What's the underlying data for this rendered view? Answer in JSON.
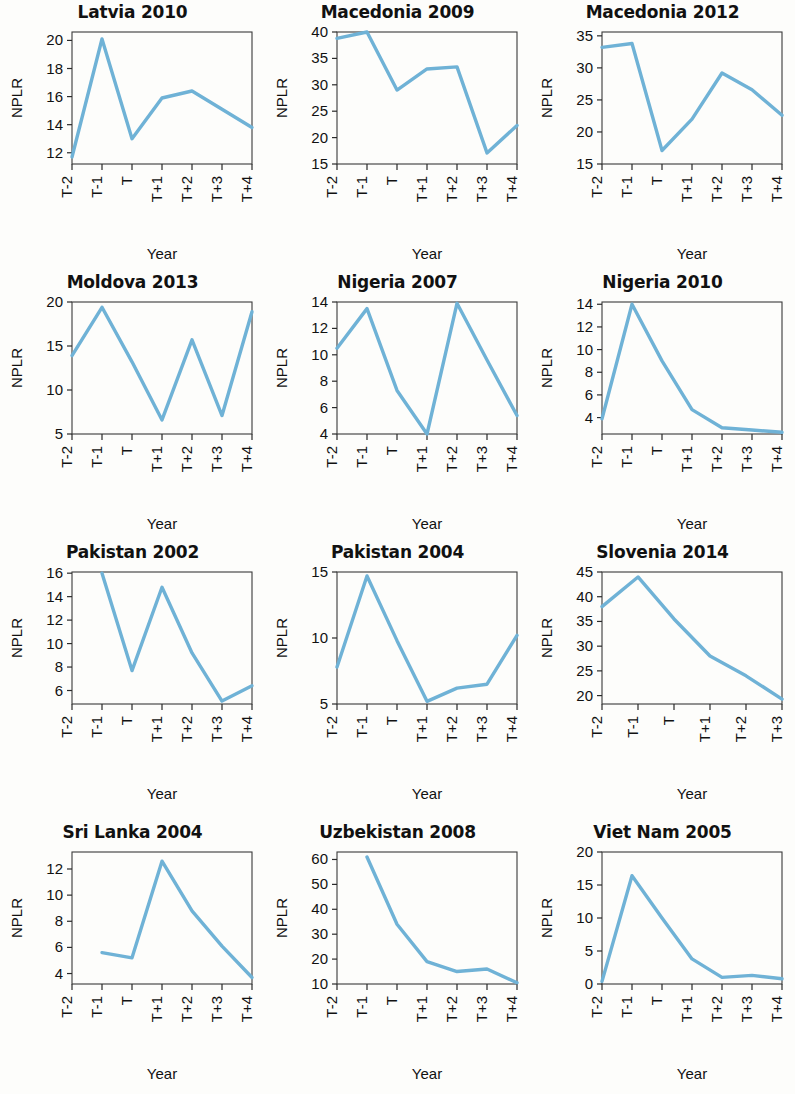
{
  "figure": {
    "line_color": "#6FB2D6",
    "axis_color": "#2a2a2a",
    "background": "#fdfdfb",
    "x_axis_label": "Year",
    "y_axis_label": "NPLR",
    "x_categories": [
      "T-2",
      "T-1",
      "T",
      "T+1",
      "T+2",
      "T+3",
      "T+4"
    ]
  },
  "chart_data": [
    {
      "type": "line",
      "title": "Latvia 2010",
      "xlabel": "Year",
      "ylabel": "NPLR",
      "x": [
        "T-2",
        "T-1",
        "T",
        "T+1",
        "T+2",
        "T+3",
        "T+4"
      ],
      "values": [
        11.7,
        20.1,
        13.0,
        15.9,
        16.4,
        15.1,
        13.8
      ],
      "ylim": [
        11.2,
        20.6
      ],
      "yticks": [
        12,
        14,
        16,
        18,
        20
      ],
      "ytick_labels": [
        "12",
        "14",
        "16",
        "18",
        "20"
      ],
      "xtick_labels": [
        "T-2",
        "T-1",
        "T",
        "T+1",
        "T+2",
        "T+3",
        "T+4"
      ],
      "grid": false,
      "legend": "none"
    },
    {
      "type": "line",
      "title": "Macedonia 2009",
      "xlabel": "Year",
      "ylabel": "NPLR",
      "x": [
        "T-2",
        "T-1",
        "T",
        "T+1",
        "T+2",
        "T+3",
        "T+4"
      ],
      "values": [
        38.8,
        40.0,
        29.0,
        33.0,
        33.4,
        17.1,
        22.3
      ],
      "ylim": [
        15,
        40
      ],
      "yticks": [
        15,
        20,
        25,
        30,
        35,
        40
      ],
      "ytick_labels": [
        "15",
        "20",
        "25",
        "30",
        "35",
        "40"
      ],
      "xtick_labels": [
        "T-2",
        "T-1",
        "T",
        "T+1",
        "T+2",
        "T+3",
        "T+4"
      ],
      "grid": false,
      "legend": "none"
    },
    {
      "type": "line",
      "title": "Macedonia 2012",
      "xlabel": "Year",
      "ylabel": "NPLR",
      "x": [
        "T-2",
        "T-1",
        "T",
        "T+1",
        "T+2",
        "T+3",
        "T+4"
      ],
      "values": [
        33.2,
        33.8,
        17.1,
        22.0,
        29.2,
        26.6,
        22.6
      ],
      "ylim": [
        15,
        35.6
      ],
      "yticks": [
        15,
        20,
        25,
        30,
        35
      ],
      "ytick_labels": [
        "15",
        "20",
        "25",
        "30",
        "35"
      ],
      "xtick_labels": [
        "T-2",
        "T-1",
        "T",
        "T+1",
        "T+2",
        "T+3",
        "T+4"
      ],
      "grid": false,
      "legend": "none"
    },
    {
      "type": "line",
      "title": "Moldova 2013",
      "xlabel": "Year",
      "ylabel": "NPLR",
      "x": [
        "T-2",
        "T-1",
        "T",
        "T+1",
        "T+2",
        "T+3",
        "T+4"
      ],
      "values": [
        13.9,
        19.4,
        13.2,
        6.6,
        15.7,
        7.1,
        18.9
      ],
      "ylim": [
        5,
        20
      ],
      "yticks": [
        5,
        10,
        15,
        20
      ],
      "ytick_labels": [
        "5",
        "10",
        "15",
        "20"
      ],
      "xtick_labels": [
        "T-2",
        "T-1",
        "T",
        "T+1",
        "T+2",
        "T+3",
        "T+4"
      ],
      "grid": false,
      "legend": "none"
    },
    {
      "type": "line",
      "title": "Nigeria 2007",
      "xlabel": "Year",
      "ylabel": "NPLR",
      "x": [
        "T-2",
        "T-1",
        "T",
        "T+1",
        "T+2",
        "T+3",
        "T+4"
      ],
      "values": [
        10.5,
        13.5,
        7.3,
        4.0,
        13.9,
        9.6,
        5.4
      ],
      "ylim": [
        4,
        14
      ],
      "yticks": [
        4,
        6,
        8,
        10,
        12,
        14
      ],
      "ytick_labels": [
        "4",
        "6",
        "8",
        "10",
        "12",
        "14"
      ],
      "xtick_labels": [
        "T-2",
        "T-1",
        "T",
        "T+1",
        "T+2",
        "T+3",
        "T+4"
      ],
      "grid": false,
      "legend": "none"
    },
    {
      "type": "line",
      "title": "Nigeria 2010",
      "xlabel": "Year",
      "ylabel": "NPLR",
      "x": [
        "T-2",
        "T-1",
        "T",
        "T+1",
        "T+2",
        "T+3",
        "T+4"
      ],
      "values": [
        3.9,
        14.0,
        9.0,
        4.7,
        3.1,
        2.9,
        2.7
      ],
      "ylim": [
        2.55,
        14.2
      ],
      "yticks": [
        4,
        6,
        8,
        10,
        12,
        14
      ],
      "ytick_labels": [
        "4",
        "6",
        "8",
        "10",
        "12",
        "14"
      ],
      "xtick_labels": [
        "T-2",
        "T-1",
        "T",
        "T+1",
        "T+2",
        "T+3",
        "T+4"
      ],
      "grid": false,
      "legend": "none"
    },
    {
      "type": "line",
      "title": "Pakistan 2002",
      "xlabel": "Year",
      "ylabel": "NPLR",
      "x": [
        "T-1",
        "T",
        "T+1",
        "T+2",
        "T+3",
        "T+4"
      ],
      "values": [
        16.0,
        7.7,
        14.8,
        9.2,
        5.1,
        6.4
      ],
      "ylim": [
        4.85,
        16.1
      ],
      "yticks": [
        6,
        8,
        10,
        12,
        14,
        16
      ],
      "ytick_labels": [
        "6",
        "8",
        "10",
        "12",
        "14",
        "16"
      ],
      "xtick_labels": [
        "T-2",
        "T-1",
        "T",
        "T+1",
        "T+2",
        "T+3",
        "T+4"
      ],
      "grid": false,
      "legend": "none"
    },
    {
      "type": "line",
      "title": "Pakistan 2004",
      "xlabel": "Year",
      "ylabel": "NPLR",
      "x": [
        "T-2",
        "T-1",
        "T",
        "T+1",
        "T+2",
        "T+3",
        "T+4"
      ],
      "values": [
        7.8,
        14.7,
        9.8,
        5.2,
        6.2,
        6.5,
        10.2
      ],
      "ylim": [
        5,
        15
      ],
      "yticks": [
        5,
        10,
        15
      ],
      "ytick_labels": [
        "5",
        "10",
        "15"
      ],
      "xtick_labels": [
        "T-2",
        "T-1",
        "T",
        "T+1",
        "T+2",
        "T+3",
        "T+4"
      ],
      "grid": false,
      "legend": "none"
    },
    {
      "type": "line",
      "title": "Slovenia 2014",
      "xlabel": "Year",
      "ylabel": "NPLR",
      "x": [
        "T-2",
        "T-1",
        "T",
        "T+1",
        "T+2",
        "T+3"
      ],
      "values": [
        38.0,
        44.0,
        35.5,
        28.0,
        24.0,
        19.3
      ],
      "ylim": [
        18.3,
        45
      ],
      "yticks": [
        20,
        25,
        30,
        35,
        40,
        45
      ],
      "ytick_labels": [
        "20",
        "25",
        "30",
        "35",
        "40",
        "45"
      ],
      "xtick_labels": [
        "T-2",
        "T-1",
        "T",
        "T+1",
        "T+2",
        "T+3"
      ],
      "grid": false,
      "legend": "none"
    },
    {
      "type": "line",
      "title": "Sri Lanka 2004",
      "xlabel": "Year",
      "ylabel": "NPLR",
      "x": [
        "T-1",
        "T",
        "T+1",
        "T+2",
        "T+3",
        "T+4"
      ],
      "values": [
        5.6,
        5.2,
        12.6,
        8.8,
        6.1,
        3.7
      ],
      "ylim": [
        3.2,
        13.3
      ],
      "yticks": [
        4,
        6,
        8,
        10,
        12
      ],
      "ytick_labels": [
        "4",
        "6",
        "8",
        "10",
        "12"
      ],
      "xtick_labels": [
        "T-2",
        "T-1",
        "T",
        "T+1",
        "T+2",
        "T+3",
        "T+4"
      ],
      "grid": false,
      "legend": "none"
    },
    {
      "type": "line",
      "title": "Uzbekistan 2008",
      "xlabel": "Year",
      "ylabel": "NPLR",
      "x": [
        "T-1",
        "T",
        "T+1",
        "T+2",
        "T+3",
        "T+4"
      ],
      "values": [
        61.0,
        34.0,
        19.0,
        15.0,
        16.0,
        10.5
      ],
      "ylim": [
        10,
        63
      ],
      "yticks": [
        10,
        20,
        30,
        40,
        50,
        60
      ],
      "ytick_labels": [
        "10",
        "20",
        "30",
        "40",
        "50",
        "60"
      ],
      "xtick_labels": [
        "T-2",
        "T-1",
        "T",
        "T+1",
        "T+2",
        "T+3",
        "T+4"
      ],
      "grid": false,
      "legend": "none"
    },
    {
      "type": "line",
      "title": "Viet Nam 2005",
      "xlabel": "Year",
      "ylabel": "NPLR",
      "x": [
        "T-2",
        "T-1",
        "T",
        "T+1",
        "T+2",
        "T+3",
        "T+4"
      ],
      "values": [
        0.4,
        16.4,
        10.0,
        3.8,
        1.0,
        1.3,
        0.8
      ],
      "ylim": [
        0,
        20
      ],
      "yticks": [
        0,
        5,
        10,
        15,
        20
      ],
      "ytick_labels": [
        "0",
        "5",
        "10",
        "15",
        "20"
      ],
      "xtick_labels": [
        "T-2",
        "T-1",
        "T",
        "T+1",
        "T+2",
        "T+3",
        "T+4"
      ],
      "grid": false,
      "legend": "none"
    }
  ]
}
